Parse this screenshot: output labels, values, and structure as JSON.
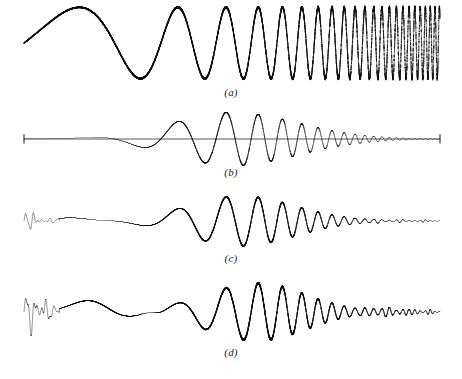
{
  "figure": {
    "background_color": "#ffffff",
    "trace_color": "#101010",
    "width": 462,
    "height": 379,
    "panel_count": 4
  },
  "panels": [
    {
      "id": "a",
      "caption": "(a)",
      "caption_x": 228,
      "caption_y": 92,
      "signal_type": "linear-chirp",
      "description": "constant-amplitude chirp, frequency increasing left to right, rectangular envelope",
      "x_start": 24,
      "x_end": 440,
      "baseline_y": 43,
      "amplitude": 36,
      "freq_start_hz": 1.4,
      "freq_end_hz": 96,
      "envelope": "rectangular",
      "has_end_ticks": false,
      "noise": 0.06
    },
    {
      "id": "b",
      "caption": "(b)",
      "caption_x": 228,
      "caption_y": 172,
      "signal_type": "chirp-spindle",
      "description": "chirp with smooth symmetric lens/spindle amplitude envelope, flat baseline with end tick marks",
      "x_start": 24,
      "x_end": 440,
      "baseline_y": 139,
      "amplitude": 27,
      "freq_start_hz": 1.4,
      "freq_end_hz": 96,
      "envelope": "gaussian-spindle",
      "envelope_center": 0.5,
      "envelope_width": 0.23,
      "has_end_ticks": true,
      "tick_height": 9,
      "noise": 0.02
    },
    {
      "id": "c",
      "caption": "(c)",
      "caption_x": 228,
      "caption_y": 258,
      "signal_type": "chirp-spindle-with-transient",
      "description": "spindle chirp plus irregular low-frequency transient at onset and intermittent decaying ripples in the tail",
      "x_start": 24,
      "x_end": 440,
      "baseline_y": 221,
      "amplitude": 25,
      "freq_start_hz": 1.4,
      "freq_end_hz": 96,
      "envelope": "gaussian-spindle",
      "envelope_center": 0.52,
      "envelope_width": 0.21,
      "has_end_ticks": false,
      "onset_transient": true,
      "onset_amplitude": 11,
      "tail_ripple": true,
      "noise": 0.05
    },
    {
      "id": "d",
      "caption": "(d)",
      "caption_x": 228,
      "caption_y": 352,
      "signal_type": "chirp-double-lobe",
      "description": "strong initial transient, early lobe, amplitude waist/null, main spindle lobe, then rippled intermittent tail",
      "x_start": 24,
      "x_end": 440,
      "baseline_y": 312,
      "amplitude": 29,
      "freq_start_hz": 1.4,
      "freq_end_hz": 96,
      "envelope": "double-lobe",
      "envelope_center": 0.56,
      "envelope_width": 0.2,
      "waist_position": 0.3,
      "early_lobe_position": 0.14,
      "early_lobe_amplitude": 13,
      "has_end_ticks": false,
      "onset_transient": true,
      "onset_amplitude": 22,
      "tail_ripple": true,
      "noise": 0.07
    }
  ],
  "chart_data": {
    "type": "line",
    "title": "",
    "xlabel": "",
    "ylabel": "",
    "subplots": [
      {
        "label": "(a)",
        "series_name": "chirp",
        "envelope_shape": "rectangular"
      },
      {
        "label": "(b)",
        "series_name": "chirp",
        "envelope_shape": "spindle"
      },
      {
        "label": "(c)",
        "series_name": "chirp",
        "envelope_shape": "spindle + onset transient + tail ripple"
      },
      {
        "label": "(d)",
        "series_name": "chirp",
        "envelope_shape": "transient + early lobe + waist + spindle + tail ripple"
      }
    ]
  }
}
